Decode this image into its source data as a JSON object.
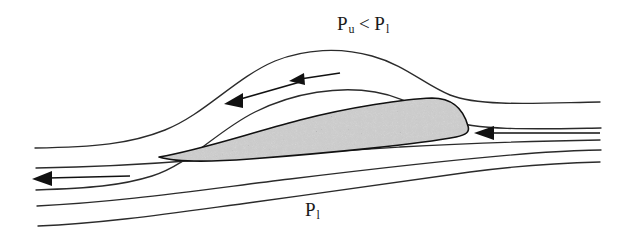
{
  "figure": {
    "background_color": "#ffffff",
    "width": 631,
    "height": 235
  },
  "labels": {
    "upper_pressure": {
      "symbol": "P",
      "subscript_upper": "u",
      "relation": "<",
      "symbol2": "P",
      "subscript_lower": "l",
      "full_text": "P u < P l"
    },
    "lower_pressure": {
      "symbol": "P",
      "subscript": "l",
      "full_text": "P l"
    }
  },
  "airfoil": {
    "name": "airfoil-cross-section",
    "fill_style": "stippled-gray-texture",
    "outline_color": "#111111",
    "fill_base_color": "#a8a8a8",
    "leading_edge": "left",
    "trailing_edge": "right",
    "chord_px": 312,
    "max_thickness_px": 46
  },
  "streamlines": {
    "count": 5,
    "stroke_color": "#2b2b2b",
    "items": [
      {
        "name": "streamline-top",
        "position": "above-airfoil-outer",
        "curvature": "strong-hump"
      },
      {
        "name": "streamline-upper",
        "position": "above-airfoil-inner",
        "curvature": "strong-hump"
      },
      {
        "name": "streamline-leading",
        "position": "through-leading-edge",
        "curvature": "slight"
      },
      {
        "name": "streamline-lower",
        "position": "below-airfoil-inner",
        "curvature": "near-straight"
      },
      {
        "name": "streamline-bottom",
        "position": "below-airfoil-outer",
        "curvature": "near-straight"
      }
    ]
  },
  "arrows": {
    "direction": "leftward",
    "flow_description": "right-to-left",
    "count": 4,
    "color": "#111111",
    "items": [
      {
        "name": "arrow-upper-inner",
        "on": "streamline-upper",
        "x": 233,
        "y": 100
      },
      {
        "name": "arrow-upper-crest",
        "on": "streamline-upper",
        "x": 296,
        "y": 81
      },
      {
        "name": "arrow-freestream-right",
        "on": "streamline-leading",
        "x": 483,
        "y": 134
      },
      {
        "name": "arrow-lower-left",
        "on": "streamline-lower",
        "x": 36,
        "y": 179
      }
    ]
  }
}
